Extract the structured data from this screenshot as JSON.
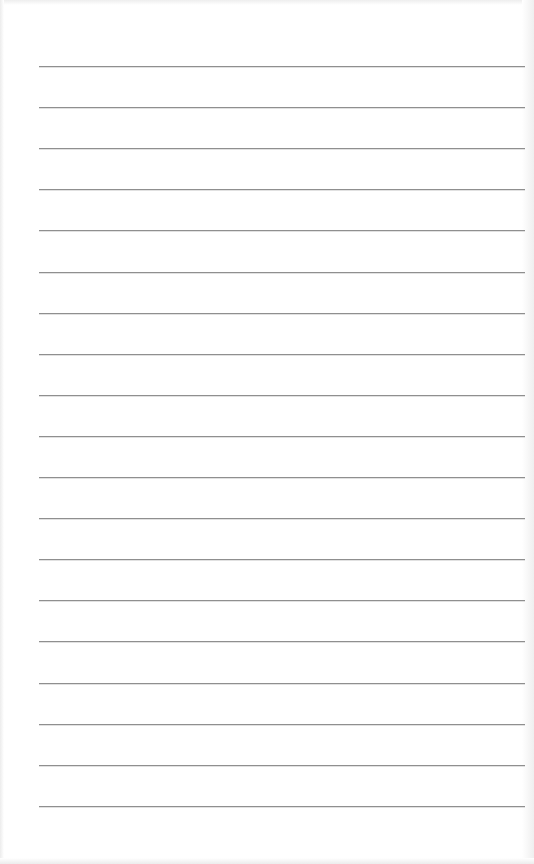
{
  "document": {
    "type": "lined-paper",
    "line_count": 19,
    "first_line_y": 66,
    "line_spacing": 41.1,
    "line_left": 39,
    "line_width": 486,
    "line_color": "#8f8f8f",
    "paper_color": "#ffffff",
    "lines": [
      "",
      "",
      "",
      "",
      "",
      "",
      "",
      "",
      "",
      "",
      "",
      "",
      "",
      "",
      "",
      "",
      "",
      "",
      ""
    ]
  }
}
